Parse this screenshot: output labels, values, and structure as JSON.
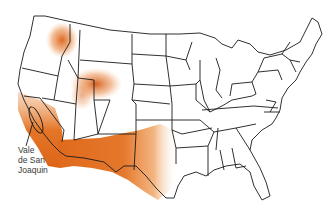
{
  "map": {
    "subject": "Contiguous United States",
    "fill_color": "#e0701e",
    "border_color": "#1a1a1a",
    "background_color": "#ffffff",
    "shaded_regions": [
      {
        "name": "northern-idaho-washington-hotspot"
      },
      {
        "name": "wyoming-utah-hotspot"
      },
      {
        "name": "california-central-valley"
      },
      {
        "name": "southwest-arizona-new-mexico-texas"
      }
    ]
  },
  "callout": {
    "lines": [
      "Vale",
      "de San",
      "Joaquin"
    ]
  }
}
